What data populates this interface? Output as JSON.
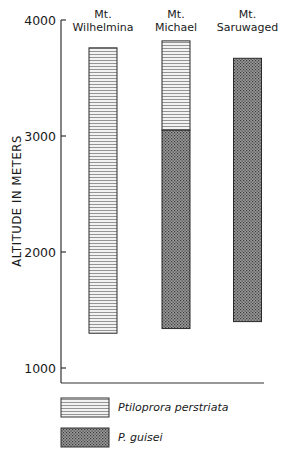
{
  "chart_data": {
    "type": "bar",
    "subtype": "floating-stacked-range",
    "title": "",
    "xlabel": "",
    "ylabel": "ALTITUDE IN METERS",
    "ylim": [
      870,
      4000
    ],
    "yticks": [
      1000,
      2000,
      3000,
      4000
    ],
    "ytick_labels": [
      "1000",
      "2000",
      "3000",
      "4000"
    ],
    "grid": false,
    "categories": [
      {
        "line1": "Mt.",
        "line2": "Wilhelmina"
      },
      {
        "line1": "Mt.",
        "line2": "Michael"
      },
      {
        "line1": "Mt.",
        "line2": "Saruwaged"
      }
    ],
    "series": [
      {
        "name": "Ptiloprora perstriata",
        "pattern": "horizontal-lines",
        "ranges": [
          [
            1300,
            3760
          ],
          [
            3050,
            3820
          ],
          null
        ]
      },
      {
        "name": "P. guisei",
        "pattern": "crosshatch-dots",
        "ranges": [
          null,
          [
            1340,
            3050
          ],
          [
            1400,
            3670
          ]
        ]
      }
    ],
    "legend": {
      "placement": "bottom-left",
      "entries": [
        {
          "label": "Ptiloprora perstriata",
          "pattern": "horizontal-lines"
        },
        {
          "label": "P. guisei",
          "pattern": "crosshatch-dots"
        }
      ]
    }
  }
}
